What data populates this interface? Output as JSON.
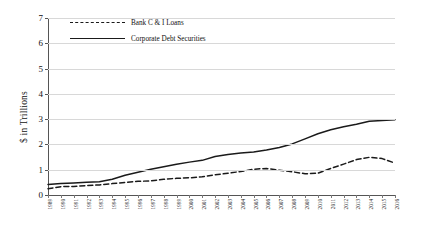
{
  "chart_data": {
    "type": "line",
    "title": "",
    "xlabel": "",
    "ylabel": "$ in Trillions",
    "ylim": [
      0,
      7
    ],
    "yticks": [
      0,
      1,
      2,
      3,
      4,
      5,
      6,
      7
    ],
    "grid": true,
    "legend_position": "top-left",
    "x": [
      "1989",
      "1990",
      "1991",
      "1992",
      "1993",
      "1994",
      "1995",
      "1996",
      "1997",
      "1998",
      "1999",
      "2000",
      "2001",
      "2002",
      "2003",
      "2004",
      "2005",
      "2006",
      "2007",
      "2008",
      "2009",
      "2010",
      "2011",
      "2012",
      "2013",
      "2014",
      "2015",
      "2016"
    ],
    "categories": [
      "1989",
      "1990",
      "1991",
      "1992",
      "1993",
      "1994",
      "1995",
      "1996",
      "1997",
      "1998",
      "1999",
      "2000",
      "2001",
      "2002",
      "2003",
      "2004",
      "2005",
      "2006",
      "2007",
      "2008",
      "2009",
      "2010",
      "2011",
      "2012",
      "2013",
      "2014",
      "2015",
      "2016"
    ],
    "series": [
      {
        "name": "Bank C & I Loans",
        "style": "dashed",
        "color": "#1a1a1a",
        "values": [
          0.25,
          0.33,
          0.34,
          0.37,
          0.4,
          0.45,
          0.5,
          0.54,
          0.56,
          0.62,
          0.66,
          0.68,
          0.72,
          0.8,
          0.86,
          0.93,
          1.02,
          1.05,
          0.98,
          0.92,
          0.84,
          0.86,
          1.05,
          1.22,
          1.4,
          1.49,
          1.44,
          1.26
        ]
      },
      {
        "name": "Corporate Debt Securities",
        "style": "solid",
        "color": "#1a1a1a",
        "values": [
          0.42,
          0.45,
          0.47,
          0.5,
          0.52,
          0.62,
          0.78,
          0.9,
          1.02,
          1.12,
          1.22,
          1.3,
          1.37,
          1.52,
          1.6,
          1.66,
          1.7,
          1.78,
          1.88,
          2.02,
          2.22,
          2.42,
          2.58,
          2.7,
          2.8,
          2.92,
          2.95,
          2.98
        ]
      }
    ],
    "bank_loans_full": [
      0.25,
      0.33,
      0.34,
      0.37,
      0.4,
      0.45,
      0.5,
      0.54,
      0.56,
      0.62,
      0.66,
      0.68,
      0.72,
      0.8,
      0.86,
      0.93,
      1.02,
      1.05,
      0.98,
      0.92,
      0.84,
      0.86,
      1.05,
      1.22,
      1.4,
      1.49,
      1.44,
      1.26
    ]
  },
  "legend": {
    "items": [
      {
        "label": "Bank C & I Loans",
        "style": "dashed"
      },
      {
        "label": "Corporate Debt Securities",
        "style": "solid"
      }
    ]
  },
  "axes": {
    "y_title": "$ in Trillions",
    "y_ticks": [
      "0",
      "1",
      "2",
      "3",
      "4",
      "5",
      "6",
      "7"
    ],
    "x_ticks": [
      "1989",
      "1990",
      "1991",
      "1992",
      "1993",
      "1994",
      "1995",
      "1996",
      "1997",
      "1998",
      "1999",
      "2000",
      "2001",
      "2002",
      "2003",
      "2004",
      "2005",
      "2006",
      "2007",
      "2008",
      "2009",
      "2010",
      "2011",
      "2012",
      "2013",
      "2014",
      "2015",
      "2016"
    ]
  },
  "colors": {
    "line": "#1a1a1a",
    "grid": "#d8d8d8",
    "axis": "#555555",
    "background": "#ffffff"
  }
}
